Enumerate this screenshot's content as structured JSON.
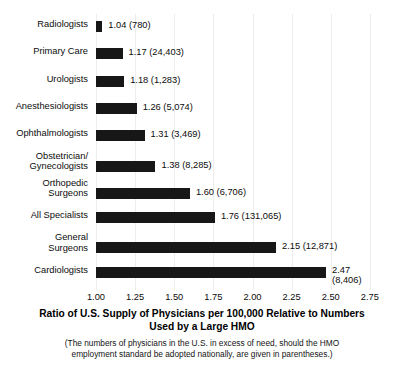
{
  "chart_data": {
    "type": "bar",
    "orientation": "horizontal",
    "title": "",
    "xlabel": "Ratio of U.S. Supply of Physicians per 100,000 Relative to Numbers Used by a Large HMO",
    "ylabel": "",
    "xlim": [
      1.0,
      2.75
    ],
    "grid": true,
    "legend": null,
    "categories": [
      "Radiologists",
      "Primary Care",
      "Urologists",
      "Anesthesiologists",
      "Ophthalmologists",
      "Obstetrician/\nGynecologists",
      "Orthopedic\nSurgeons",
      "All Specialists",
      "General\nSurgeons",
      "Cardiologists"
    ],
    "values": [
      1.04,
      1.17,
      1.18,
      1.26,
      1.31,
      1.38,
      1.6,
      1.76,
      2.15,
      2.47
    ],
    "excess_counts": [
      780,
      24403,
      1283,
      5074,
      3469,
      8285,
      6706,
      131065,
      12871,
      8406
    ],
    "data_labels": [
      "1.04 (780)",
      "1.17 (24,403)",
      "1.18 (1,283)",
      "1.26 (5,074)",
      "1.31 (3,469)",
      "1.38 (8,285)",
      "1.60 (6,706)",
      "1.76 (131,065)",
      "2.15 (12,871)",
      "2.47\n(8,406)"
    ],
    "xticks": [
      1.0,
      1.25,
      1.5,
      1.75,
      2.0,
      2.25,
      2.5,
      2.75
    ],
    "xtick_labels": [
      "1.00",
      "1.25",
      "1.50",
      "1.75",
      "2.00",
      "2.25",
      "2.50",
      "2.75"
    ],
    "bar_color": "#171717",
    "gridline_color": "#ededed",
    "background_color": "#ffffff"
  },
  "axis_title": {
    "line1": "Ratio of U.S. Supply of Physicians per 100,000 Relative to Numbers",
    "line2": "Used by a Large HMO"
  },
  "footnote": {
    "line1": "(The numbers of physicians in the U.S. in excess of need, should the HMO",
    "line2": "employment standard be adopted nationally, are given in parentheses.)"
  }
}
